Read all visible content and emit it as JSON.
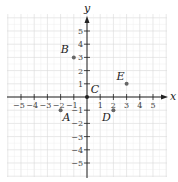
{
  "chart_data": {
    "type": "scatter",
    "title": "",
    "xlabel": "x",
    "ylabel": "y",
    "xlim": [
      -6,
      6
    ],
    "ylim": [
      -6,
      6
    ],
    "grid": true,
    "x_ticks": [
      -5,
      -4,
      -3,
      -2,
      -1,
      1,
      2,
      3,
      4,
      5
    ],
    "y_ticks": [
      -5,
      -4,
      -3,
      -2,
      -1,
      1,
      2,
      3,
      4,
      5
    ],
    "points": [
      {
        "label": "A",
        "x": -2,
        "y": -1
      },
      {
        "label": "B",
        "x": -1,
        "y": 3
      },
      {
        "label": "C",
        "x": 0,
        "y": 0
      },
      {
        "label": "D",
        "x": 2,
        "y": -1
      },
      {
        "label": "E",
        "x": 3,
        "y": 1
      }
    ]
  },
  "axes": {
    "x_label": "x",
    "y_label": "y"
  },
  "colors": {
    "grid": "#d9d9d9",
    "axis": "#222222",
    "point": "#666666"
  }
}
